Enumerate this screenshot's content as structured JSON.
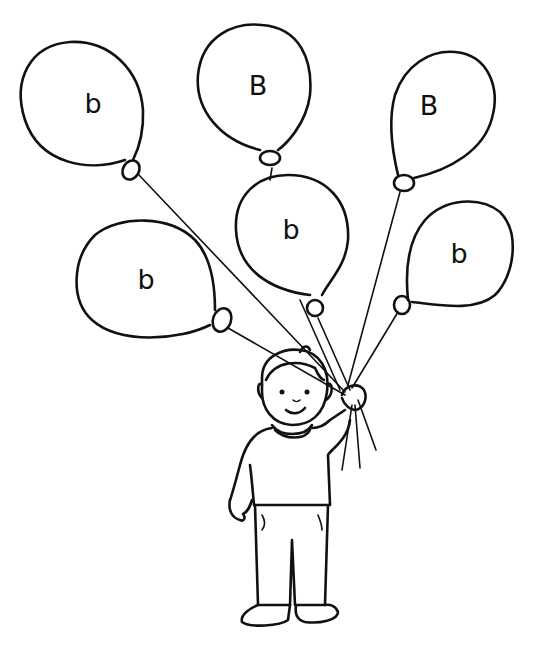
{
  "colors": {
    "line": "#111111",
    "background": "#ffffff"
  },
  "balloons": [
    {
      "id": "top-left",
      "letter": "b",
      "cx": 93,
      "cy": 103
    },
    {
      "id": "top-center",
      "letter": "B",
      "cx": 258,
      "cy": 85
    },
    {
      "id": "top-right",
      "letter": "B",
      "cx": 429,
      "cy": 105
    },
    {
      "id": "middle-center",
      "letter": "b",
      "cx": 291,
      "cy": 229
    },
    {
      "id": "middle-left",
      "letter": "b",
      "cx": 146,
      "cy": 279
    },
    {
      "id": "middle-right",
      "letter": "b",
      "cx": 459,
      "cy": 253
    }
  ]
}
